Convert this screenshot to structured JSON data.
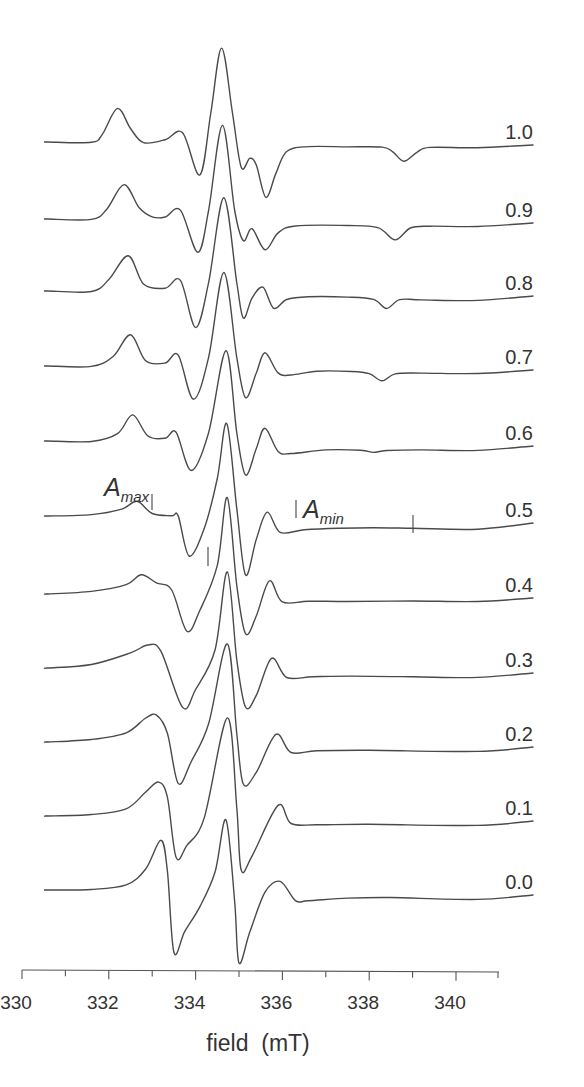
{
  "chart_data": {
    "type": "line",
    "title": "",
    "xlabel": "field  (mT)",
    "ylabel": "",
    "xlim": [
      330,
      341
    ],
    "xticks_major": [
      330,
      332,
      334,
      336,
      338,
      340
    ],
    "xticks_minor": [
      331,
      333,
      335,
      337,
      339
    ],
    "grid": false,
    "legend": "inline labels at right end of each trace",
    "annotations": [
      {
        "text": "A",
        "sub": "max",
        "x_mT": 332.65,
        "trace": "0.5",
        "markers_mT": [
          332.65,
          333.85
        ]
      },
      {
        "text": "A",
        "sub": "min",
        "x_mT": 335.65,
        "trace": "0.5",
        "markers_mT": [
          335.65,
          338.1
        ]
      }
    ],
    "series_note": "EPR spectra (first derivative), vertically offset; points are [field mT, deflection px from baseline, negative = up]",
    "series": [
      {
        "name": "1.0",
        "baseline_left": 142,
        "baseline_right": 145,
        "points": [
          [
            330.6,
            0
          ],
          [
            331.6,
            0
          ],
          [
            331.85,
            -8
          ],
          [
            332.2,
            -34
          ],
          [
            332.5,
            -14
          ],
          [
            332.8,
            0
          ],
          [
            333.3,
            -3
          ],
          [
            333.7,
            -10
          ],
          [
            334.1,
            32
          ],
          [
            334.35,
            -30
          ],
          [
            334.6,
            -95
          ],
          [
            334.85,
            -30
          ],
          [
            335.05,
            24
          ],
          [
            335.25,
            15
          ],
          [
            335.4,
            22
          ],
          [
            335.62,
            54
          ],
          [
            335.85,
            30
          ],
          [
            336.1,
            8
          ],
          [
            336.6,
            3
          ],
          [
            337.5,
            3
          ],
          [
            338.3,
            3
          ],
          [
            338.55,
            8
          ],
          [
            338.8,
            17
          ],
          [
            339.1,
            8
          ],
          [
            339.4,
            3
          ],
          [
            340.5,
            3
          ]
        ]
      },
      {
        "name": "0.9",
        "baseline_left": 219,
        "baseline_right": 223,
        "points": [
          [
            330.6,
            0
          ],
          [
            331.6,
            0
          ],
          [
            331.95,
            -10
          ],
          [
            332.35,
            -35
          ],
          [
            332.7,
            -12
          ],
          [
            333.0,
            -3
          ],
          [
            333.3,
            -3
          ],
          [
            333.65,
            -10
          ],
          [
            334.05,
            32
          ],
          [
            334.3,
            -10
          ],
          [
            334.62,
            -95
          ],
          [
            334.9,
            -10
          ],
          [
            335.1,
            20
          ],
          [
            335.3,
            8
          ],
          [
            335.6,
            29
          ],
          [
            335.9,
            12
          ],
          [
            336.3,
            5
          ],
          [
            337.5,
            4
          ],
          [
            338.2,
            6
          ],
          [
            338.6,
            18
          ],
          [
            338.95,
            6
          ],
          [
            339.4,
            4
          ],
          [
            340.5,
            4
          ]
        ]
      },
      {
        "name": "0.8",
        "baseline_left": 291,
        "baseline_right": 296,
        "points": [
          [
            330.6,
            0
          ],
          [
            331.6,
            0
          ],
          [
            332.0,
            -12
          ],
          [
            332.45,
            -36
          ],
          [
            332.8,
            -8
          ],
          [
            333.3,
            -4
          ],
          [
            333.65,
            -12
          ],
          [
            334.0,
            35
          ],
          [
            334.3,
            -10
          ],
          [
            334.65,
            -95
          ],
          [
            334.95,
            -10
          ],
          [
            335.1,
            25
          ],
          [
            335.3,
            5
          ],
          [
            335.55,
            -6
          ],
          [
            335.8,
            15
          ],
          [
            336.1,
            6
          ],
          [
            336.6,
            3
          ],
          [
            337.5,
            3
          ],
          [
            338.1,
            5
          ],
          [
            338.4,
            14
          ],
          [
            338.7,
            5
          ],
          [
            339.2,
            5
          ],
          [
            340.5,
            5
          ]
        ]
      },
      {
        "name": "0.7",
        "baseline_left": 366,
        "baseline_right": 370,
        "points": [
          [
            330.6,
            0
          ],
          [
            331.6,
            0
          ],
          [
            332.1,
            -10
          ],
          [
            332.5,
            -32
          ],
          [
            332.85,
            -6
          ],
          [
            333.3,
            -4
          ],
          [
            333.6,
            -12
          ],
          [
            333.95,
            32
          ],
          [
            334.3,
            -10
          ],
          [
            334.65,
            -95
          ],
          [
            334.95,
            -10
          ],
          [
            335.15,
            30
          ],
          [
            335.4,
            5
          ],
          [
            335.6,
            -15
          ],
          [
            335.9,
            5
          ],
          [
            336.2,
            7
          ],
          [
            336.8,
            3
          ],
          [
            337.6,
            3
          ],
          [
            338.0,
            5
          ],
          [
            338.3,
            12
          ],
          [
            338.6,
            5
          ],
          [
            339.2,
            4
          ],
          [
            340.5,
            4
          ]
        ]
      },
      {
        "name": "0.6",
        "baseline_left": 441,
        "baseline_right": 446,
        "points": [
          [
            330.6,
            0
          ],
          [
            331.6,
            0
          ],
          [
            332.2,
            -8
          ],
          [
            332.55,
            -27
          ],
          [
            332.9,
            -6
          ],
          [
            333.3,
            -4
          ],
          [
            333.55,
            -10
          ],
          [
            333.9,
            28
          ],
          [
            334.3,
            -10
          ],
          [
            334.7,
            -92
          ],
          [
            334.95,
            -10
          ],
          [
            335.15,
            32
          ],
          [
            335.4,
            5
          ],
          [
            335.6,
            -15
          ],
          [
            335.9,
            8
          ],
          [
            336.2,
            10
          ],
          [
            337.0,
            6
          ],
          [
            337.8,
            6
          ],
          [
            338.1,
            8
          ],
          [
            338.4,
            6
          ],
          [
            339.2,
            5
          ],
          [
            340.5,
            5
          ]
        ]
      },
      {
        "name": "0.5",
        "baseline_left": 516,
        "baseline_right": 523,
        "points": [
          [
            330.6,
            0
          ],
          [
            331.6,
            -2
          ],
          [
            332.3,
            -8
          ],
          [
            332.65,
            -16
          ],
          [
            333.0,
            -4
          ],
          [
            333.45,
            -2
          ],
          [
            333.6,
            -2
          ],
          [
            333.85,
            38
          ],
          [
            334.2,
            10
          ],
          [
            334.5,
            -40
          ],
          [
            334.72,
            -95
          ],
          [
            334.95,
            -10
          ],
          [
            335.15,
            56
          ],
          [
            335.4,
            20
          ],
          [
            335.65,
            -7
          ],
          [
            335.95,
            13
          ],
          [
            336.5,
            10
          ],
          [
            337.3,
            8
          ],
          [
            338.1,
            7
          ],
          [
            339.0,
            7
          ],
          [
            340.5,
            7
          ]
        ]
      },
      {
        "name": "0.4",
        "baseline_left": 594,
        "baseline_right": 598,
        "points": [
          [
            330.6,
            0
          ],
          [
            331.6,
            -3
          ],
          [
            332.4,
            -10
          ],
          [
            332.75,
            -20
          ],
          [
            333.1,
            -12
          ],
          [
            333.45,
            -5
          ],
          [
            333.8,
            36
          ],
          [
            334.1,
            15
          ],
          [
            334.5,
            -30
          ],
          [
            334.73,
            -98
          ],
          [
            334.95,
            -10
          ],
          [
            335.15,
            38
          ],
          [
            335.4,
            20
          ],
          [
            335.7,
            -15
          ],
          [
            336.0,
            6
          ],
          [
            336.6,
            5
          ],
          [
            337.5,
            5
          ],
          [
            339.0,
            4
          ],
          [
            340.5,
            4
          ]
        ]
      },
      {
        "name": "0.3",
        "baseline_left": 668,
        "baseline_right": 673,
        "points": [
          [
            330.6,
            0
          ],
          [
            331.6,
            -4
          ],
          [
            332.5,
            -16
          ],
          [
            332.9,
            -24
          ],
          [
            333.2,
            -18
          ],
          [
            333.7,
            38
          ],
          [
            334.0,
            20
          ],
          [
            334.45,
            -20
          ],
          [
            334.73,
            -98
          ],
          [
            334.95,
            -10
          ],
          [
            335.15,
            37
          ],
          [
            335.4,
            25
          ],
          [
            335.75,
            -12
          ],
          [
            336.1,
            7
          ],
          [
            336.7,
            6
          ],
          [
            337.6,
            5
          ],
          [
            339.0,
            5
          ],
          [
            340.5,
            5
          ]
        ]
      },
      {
        "name": "0.2",
        "baseline_left": 742,
        "baseline_right": 747,
        "points": [
          [
            330.6,
            0
          ],
          [
            331.6,
            -3
          ],
          [
            332.4,
            -10
          ],
          [
            332.85,
            -25
          ],
          [
            333.1,
            -28
          ],
          [
            333.35,
            -10
          ],
          [
            333.6,
            40
          ],
          [
            333.9,
            18
          ],
          [
            334.3,
            -20
          ],
          [
            334.73,
            -100
          ],
          [
            334.95,
            -10
          ],
          [
            335.1,
            40
          ],
          [
            335.4,
            28
          ],
          [
            335.85,
            -10
          ],
          [
            336.2,
            8
          ],
          [
            336.8,
            6
          ],
          [
            338.0,
            5
          ],
          [
            340.5,
            5
          ]
        ]
      },
      {
        "name": "0.1",
        "baseline_left": 816,
        "baseline_right": 821,
        "points": [
          [
            330.6,
            0
          ],
          [
            331.6,
            -2
          ],
          [
            332.4,
            -8
          ],
          [
            332.85,
            -25
          ],
          [
            333.15,
            -35
          ],
          [
            333.35,
            -20
          ],
          [
            333.55,
            40
          ],
          [
            333.8,
            28
          ],
          [
            334.2,
            0
          ],
          [
            334.73,
            -100
          ],
          [
            334.95,
            -10
          ],
          [
            335.05,
            52
          ],
          [
            335.3,
            38
          ],
          [
            335.9,
            -13
          ],
          [
            336.2,
            5
          ],
          [
            336.8,
            6
          ],
          [
            338.0,
            5
          ],
          [
            340.5,
            5
          ]
        ]
      },
      {
        "name": "0.0",
        "baseline_left": 890,
        "baseline_right": 895,
        "points": [
          [
            330.6,
            0
          ],
          [
            331.6,
            -1
          ],
          [
            332.4,
            -6
          ],
          [
            332.85,
            -22
          ],
          [
            333.2,
            -51
          ],
          [
            333.35,
            -20
          ],
          [
            333.5,
            61
          ],
          [
            333.75,
            40
          ],
          [
            334.1,
            15
          ],
          [
            334.45,
            -20
          ],
          [
            334.7,
            -72
          ],
          [
            334.9,
            10
          ],
          [
            335.0,
            71
          ],
          [
            335.25,
            40
          ],
          [
            335.6,
            0
          ],
          [
            335.95,
            -11
          ],
          [
            336.3,
            8
          ],
          [
            336.6,
            8
          ],
          [
            337.5,
            5
          ],
          [
            338.5,
            4
          ],
          [
            340.5,
            5
          ]
        ]
      }
    ]
  },
  "axis": {
    "tick_labels": [
      "330",
      "332",
      "334",
      "336",
      "338",
      "340"
    ],
    "label": "field  (mT)"
  },
  "annotations": {
    "amax": {
      "letter": "A",
      "sub": "max"
    },
    "amin": {
      "letter": "A",
      "sub": "min"
    }
  }
}
